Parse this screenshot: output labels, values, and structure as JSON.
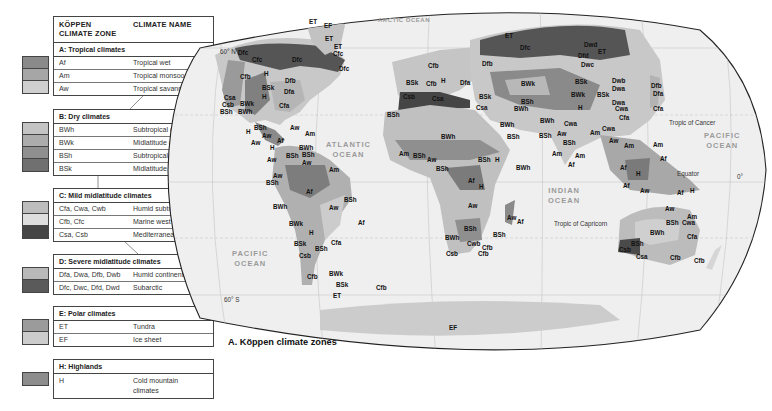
{
  "legend": {
    "header": {
      "zone_col": "KÖPPEN CLIMATE ZONE",
      "zone_col_line1": "KÖPPEN",
      "zone_col_line2": "CLIMATE ZONE",
      "name_col": "CLIMATE NAME"
    },
    "groups": [
      {
        "title": "A: Tropical climates",
        "rows": [
          {
            "code": "Af",
            "name": "Tropical wet",
            "color": "#8a8a8a"
          },
          {
            "code": "Am",
            "name": "Tropical monsoon",
            "color": "#a6a6a6"
          },
          {
            "code": "Aw",
            "name": "Tropical savanna",
            "color": "#cfcfcf"
          }
        ]
      },
      {
        "title": "B: Dry climates",
        "rows": [
          {
            "code": "BWh",
            "name": "Subtropical desert",
            "color": "#c4c4c4"
          },
          {
            "code": "BWk",
            "name": "Midlatitude desert",
            "color": "#acacac"
          },
          {
            "code": "BSh",
            "name": "Subtropical steppe",
            "color": "#8f8f8f"
          },
          {
            "code": "BSk",
            "name": "Midlatitude steppe",
            "color": "#707070"
          }
        ]
      },
      {
        "title": "C: Mild midlatitude climates",
        "rows": [
          {
            "code": "Cfa, Cwa, Cwb",
            "name": "Humid subtropical",
            "color": "#bdbdbd"
          },
          {
            "code": "Cfb, Cfc",
            "name": "Marine west coast",
            "color": "#dedede"
          },
          {
            "code": "Csa, Csb",
            "name": "Mediterranean",
            "color": "#454545"
          }
        ]
      },
      {
        "title": "D: Severe midlatitude climates",
        "rows": [
          {
            "code": "Dfa, Dwa, Dfb, Dwb",
            "name": "Humid continental",
            "color": "#b9b9b9"
          },
          {
            "code": "Dfc, Dwc, Dfd, Dwd",
            "name": "Subarctic",
            "color": "#5a5a5a"
          }
        ]
      },
      {
        "title": "E: Polar climates",
        "rows": [
          {
            "code": "ET",
            "name": "Tundra",
            "color": "#9b9b9b"
          },
          {
            "code": "EF",
            "name": "Ice sheet",
            "color": "#cccccc"
          }
        ]
      },
      {
        "title": "H: Highlands",
        "rows": [
          {
            "code": "H",
            "name": "Cold mountain climates",
            "name_line1": "Cold mountain",
            "name_line2": "climates",
            "color": "#8d8d8d"
          }
        ]
      }
    ]
  },
  "map": {
    "title": "A. Köppen climate zones",
    "oceans": {
      "arctic": "ARCTIC OCEAN",
      "atlantic_1": "ATLANTIC",
      "atlantic_2": "OCEAN",
      "pacific_w_1": "PACIFIC",
      "pacific_w_2": "OCEAN",
      "pacific_e_1": "PACIFIC",
      "pacific_e_2": "OCEAN",
      "indian_1": "INDIAN",
      "indian_2": "OCEAN"
    },
    "geo_lines": {
      "lat_60n": "60° N",
      "lat_60s": "60° S",
      "tropic_cancer": "Tropic of Cancer",
      "tropic_capricorn": "Tropic of Capricorn",
      "equator": "Equator",
      "zero": "0°"
    },
    "labels": [
      {
        "t": "EF",
        "x": 324,
        "y": 22
      },
      {
        "t": "ET",
        "x": 325,
        "y": 35
      },
      {
        "t": "ET",
        "x": 334,
        "y": 43
      },
      {
        "t": "Cfc",
        "x": 333,
        "y": 50
      },
      {
        "t": "ET",
        "x": 309,
        "y": 18
      },
      {
        "t": "Dfc",
        "x": 238,
        "y": 49
      },
      {
        "t": "Cfc",
        "x": 252,
        "y": 56
      },
      {
        "t": "Dfc",
        "x": 292,
        "y": 56
      },
      {
        "t": "Dfc",
        "x": 339,
        "y": 65
      },
      {
        "t": "Cfb",
        "x": 240,
        "y": 73
      },
      {
        "t": "H",
        "x": 264,
        "y": 70
      },
      {
        "t": "Dfb",
        "x": 285,
        "y": 77
      },
      {
        "t": "BSk",
        "x": 262,
        "y": 84
      },
      {
        "t": "Dfa",
        "x": 284,
        "y": 88
      },
      {
        "t": "H",
        "x": 262,
        "y": 93
      },
      {
        "t": "Csa",
        "x": 224,
        "y": 94
      },
      {
        "t": "Csb",
        "x": 222,
        "y": 101
      },
      {
        "t": "BWk",
        "x": 240,
        "y": 100
      },
      {
        "t": "Cfa",
        "x": 279,
        "y": 102
      },
      {
        "t": "BSh",
        "x": 220,
        "y": 108
      },
      {
        "t": "BWh",
        "x": 238,
        "y": 108
      },
      {
        "t": "BSh",
        "x": 254,
        "y": 124
      },
      {
        "t": "H",
        "x": 246,
        "y": 128
      },
      {
        "t": "Aw",
        "x": 290,
        "y": 124
      },
      {
        "t": "Am",
        "x": 305,
        "y": 130
      },
      {
        "t": "Aw",
        "x": 262,
        "y": 132
      },
      {
        "t": "Af",
        "x": 277,
        "y": 137
      },
      {
        "t": "Aw",
        "x": 251,
        "y": 139
      },
      {
        "t": "H",
        "x": 270,
        "y": 144
      },
      {
        "t": "BWh",
        "x": 299,
        "y": 144
      },
      {
        "t": "BSh",
        "x": 286,
        "y": 152
      },
      {
        "t": "BSh",
        "x": 302,
        "y": 151
      },
      {
        "t": "Aw",
        "x": 267,
        "y": 156
      },
      {
        "t": "Aw",
        "x": 302,
        "y": 159
      },
      {
        "t": "Am",
        "x": 329,
        "y": 166
      },
      {
        "t": "Aw",
        "x": 273,
        "y": 172
      },
      {
        "t": "BSh",
        "x": 266,
        "y": 179
      },
      {
        "t": "Af",
        "x": 306,
        "y": 188
      },
      {
        "t": "BSh",
        "x": 344,
        "y": 196
      },
      {
        "t": "BWh",
        "x": 273,
        "y": 203
      },
      {
        "t": "Aw",
        "x": 329,
        "y": 204
      },
      {
        "t": "Af",
        "x": 358,
        "y": 219
      },
      {
        "t": "BWk",
        "x": 289,
        "y": 220
      },
      {
        "t": "H",
        "x": 309,
        "y": 229
      },
      {
        "t": "Cfa",
        "x": 331,
        "y": 239
      },
      {
        "t": "BSk",
        "x": 294,
        "y": 240
      },
      {
        "t": "BSh",
        "x": 315,
        "y": 245
      },
      {
        "t": "Csb",
        "x": 299,
        "y": 252
      },
      {
        "t": "Cfb",
        "x": 307,
        "y": 273
      },
      {
        "t": "BWk",
        "x": 329,
        "y": 270
      },
      {
        "t": "BSk",
        "x": 336,
        "y": 281
      },
      {
        "t": "ET",
        "x": 333,
        "y": 292
      },
      {
        "t": "Cfb",
        "x": 376,
        "y": 284
      },
      {
        "t": "BSk",
        "x": 406,
        "y": 79
      },
      {
        "t": "Cfb",
        "x": 426,
        "y": 80
      },
      {
        "t": "H",
        "x": 441,
        "y": 77
      },
      {
        "t": "Dfa",
        "x": 460,
        "y": 79
      },
      {
        "t": "Csb",
        "x": 403,
        "y": 93
      },
      {
        "t": "Csa",
        "x": 432,
        "y": 95
      },
      {
        "t": "Cfb",
        "x": 428,
        "y": 62
      },
      {
        "t": "BSh",
        "x": 387,
        "y": 111
      },
      {
        "t": "BSk",
        "x": 479,
        "y": 93
      },
      {
        "t": "Csa",
        "x": 476,
        "y": 104
      },
      {
        "t": "Dfc",
        "x": 520,
        "y": 44
      },
      {
        "t": "ET",
        "x": 505,
        "y": 32
      },
      {
        "t": "Dfb",
        "x": 482,
        "y": 60
      },
      {
        "t": "BWk",
        "x": 521,
        "y": 80
      },
      {
        "t": "BSh",
        "x": 521,
        "y": 98
      },
      {
        "t": "BWh",
        "x": 514,
        "y": 105
      },
      {
        "t": "BWh",
        "x": 441,
        "y": 133
      },
      {
        "t": "BWh",
        "x": 500,
        "y": 121
      },
      {
        "t": "BSh",
        "x": 507,
        "y": 133
      },
      {
        "t": "Dwd",
        "x": 584,
        "y": 41
      },
      {
        "t": "ET",
        "x": 598,
        "y": 48
      },
      {
        "t": "Dfd",
        "x": 578,
        "y": 52
      },
      {
        "t": "Dwc",
        "x": 581,
        "y": 61
      },
      {
        "t": "BSk",
        "x": 575,
        "y": 78
      },
      {
        "t": "BWk",
        "x": 571,
        "y": 91
      },
      {
        "t": "H",
        "x": 578,
        "y": 104
      },
      {
        "t": "Dwb",
        "x": 612,
        "y": 77
      },
      {
        "t": "Dwa",
        "x": 612,
        "y": 85
      },
      {
        "t": "BSk",
        "x": 597,
        "y": 91
      },
      {
        "t": "Dwa",
        "x": 612,
        "y": 99
      },
      {
        "t": "Cwa",
        "x": 615,
        "y": 105
      },
      {
        "t": "Cfa",
        "x": 619,
        "y": 114
      },
      {
        "t": "Dfb",
        "x": 651,
        "y": 82
      },
      {
        "t": "Dfa",
        "x": 653,
        "y": 90
      },
      {
        "t": "Cfa",
        "x": 653,
        "y": 105
      },
      {
        "t": "BWh",
        "x": 540,
        "y": 117
      },
      {
        "t": "Cwa",
        "x": 564,
        "y": 120
      },
      {
        "t": "Cwa",
        "x": 602,
        "y": 125
      },
      {
        "t": "BSh",
        "x": 539,
        "y": 132
      },
      {
        "t": "Aw",
        "x": 557,
        "y": 130
      },
      {
        "t": "Am",
        "x": 590,
        "y": 129
      },
      {
        "t": "BSh",
        "x": 563,
        "y": 139
      },
      {
        "t": "Am",
        "x": 552,
        "y": 150
      },
      {
        "t": "Am",
        "x": 575,
        "y": 152
      },
      {
        "t": "Af",
        "x": 568,
        "y": 161
      },
      {
        "t": "Aw",
        "x": 609,
        "y": 137
      },
      {
        "t": "Am",
        "x": 624,
        "y": 142
      },
      {
        "t": "Am",
        "x": 653,
        "y": 141
      },
      {
        "t": "Af",
        "x": 660,
        "y": 155
      },
      {
        "t": "Af",
        "x": 620,
        "y": 164
      },
      {
        "t": "H",
        "x": 636,
        "y": 170
      },
      {
        "t": "Af",
        "x": 623,
        "y": 182
      },
      {
        "t": "Aw",
        "x": 640,
        "y": 187
      },
      {
        "t": "Af",
        "x": 677,
        "y": 189
      },
      {
        "t": "H",
        "x": 690,
        "y": 187
      },
      {
        "t": "Am",
        "x": 399,
        "y": 150
      },
      {
        "t": "Aw",
        "x": 427,
        "y": 156
      },
      {
        "t": "BSh",
        "x": 413,
        "y": 152
      },
      {
        "t": "BSh",
        "x": 478,
        "y": 156
      },
      {
        "t": "H",
        "x": 495,
        "y": 156
      },
      {
        "t": "BWh",
        "x": 516,
        "y": 164
      },
      {
        "t": "BSh",
        "x": 436,
        "y": 165
      },
      {
        "t": "Af",
        "x": 468,
        "y": 177
      },
      {
        "t": "H",
        "x": 479,
        "y": 183
      },
      {
        "t": "Aw",
        "x": 468,
        "y": 202
      },
      {
        "t": "Aw",
        "x": 507,
        "y": 214
      },
      {
        "t": "Af",
        "x": 517,
        "y": 218
      },
      {
        "t": "BSh",
        "x": 464,
        "y": 225
      },
      {
        "t": "BSh",
        "x": 493,
        "y": 231
      },
      {
        "t": "BWh",
        "x": 445,
        "y": 234
      },
      {
        "t": "Cwb",
        "x": 467,
        "y": 240
      },
      {
        "t": "Cfb",
        "x": 482,
        "y": 244
      },
      {
        "t": "Csb",
        "x": 446,
        "y": 250
      },
      {
        "t": "Cfb",
        "x": 478,
        "y": 250
      },
      {
        "t": "Aw",
        "x": 665,
        "y": 205
      },
      {
        "t": "Am",
        "x": 687,
        "y": 213
      },
      {
        "t": "BSh",
        "x": 666,
        "y": 219
      },
      {
        "t": "Cwa",
        "x": 682,
        "y": 219
      },
      {
        "t": "BWh",
        "x": 650,
        "y": 229
      },
      {
        "t": "Cfa",
        "x": 687,
        "y": 233
      },
      {
        "t": "BSh",
        "x": 631,
        "y": 240
      },
      {
        "t": "Csb",
        "x": 619,
        "y": 246
      },
      {
        "t": "Csa",
        "x": 636,
        "y": 253
      },
      {
        "t": "Cfb",
        "x": 670,
        "y": 254
      },
      {
        "t": "Cfb",
        "x": 694,
        "y": 257
      },
      {
        "t": "EF",
        "x": 449,
        "y": 324
      }
    ]
  }
}
